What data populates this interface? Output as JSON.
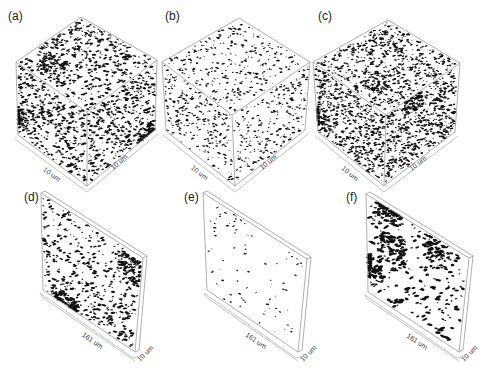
{
  "figure": {
    "width": 494,
    "height": 369,
    "background": "#ffffff",
    "particle_color": "#111111",
    "edge_color": "#9a9a9a"
  },
  "panels": [
    {
      "id": "a",
      "label": "(a)",
      "type": "cube",
      "label_pos": [
        8,
        20
      ],
      "dim_labels": [
        "10 um",
        "10 um"
      ],
      "density": 1.0,
      "cluster": 0.15,
      "size": 1.1,
      "seed": 11,
      "geom": {
        "top": [
          81,
          17
        ],
        "lt": [
          16,
          62
        ],
        "rt": [
          157,
          60
        ],
        "ft": [
          87,
          112
        ],
        "fb": [
          87,
          186
        ],
        "lb": [
          18,
          135
        ],
        "rb": [
          155,
          130
        ]
      }
    },
    {
      "id": "b",
      "label": "(b)",
      "type": "cube",
      "label_pos": [
        165,
        20
      ],
      "dim_labels": [
        "10 um",
        "10 um"
      ],
      "density": 0.55,
      "cluster": 0.0,
      "size": 0.9,
      "seed": 23,
      "geom": {
        "top": [
          239,
          18
        ],
        "lt": [
          162,
          62
        ],
        "rt": [
          310,
          62
        ],
        "ft": [
          232,
          115
        ],
        "fb": [
          235,
          186
        ],
        "lb": [
          166,
          131
        ],
        "rb": [
          305,
          130
        ]
      }
    },
    {
      "id": "c",
      "label": "(c)",
      "type": "cube",
      "label_pos": [
        318,
        20
      ],
      "dim_labels": [
        "10 um",
        "10 um"
      ],
      "density": 1.35,
      "cluster": 0.1,
      "size": 1.0,
      "seed": 37,
      "geom": {
        "top": [
          388,
          20
        ],
        "lt": [
          313,
          62
        ],
        "rt": [
          460,
          63
        ],
        "ft": [
          386,
          115
        ],
        "fb": [
          384,
          186
        ],
        "lb": [
          318,
          132
        ],
        "rb": [
          455,
          132
        ]
      }
    },
    {
      "id": "d",
      "label": "(d)",
      "type": "slab",
      "label_pos": [
        24,
        201
      ],
      "dim_labels": [
        "161 um",
        "10 um"
      ],
      "density": 0.9,
      "cluster": 0.35,
      "size": 1.2,
      "seed": 41,
      "geom": {
        "tl": [
          41,
          193
        ],
        "tr": [
          143,
          258
        ],
        "br": [
          135,
          352
        ],
        "bl": [
          43,
          290
        ],
        "thick": [
          4,
          -2
        ]
      }
    },
    {
      "id": "e",
      "label": "(e)",
      "type": "slab",
      "label_pos": [
        184,
        201
      ],
      "dim_labels": [
        "161 um",
        "10 um"
      ],
      "density": 0.12,
      "cluster": 0.2,
      "size": 0.9,
      "seed": 53,
      "geom": {
        "tl": [
          203,
          193
        ],
        "tr": [
          307,
          259
        ],
        "br": [
          298,
          352
        ],
        "bl": [
          207,
          290
        ],
        "thick": [
          4,
          -2
        ]
      }
    },
    {
      "id": "f",
      "label": "(f)",
      "type": "slab",
      "label_pos": [
        346,
        201
      ],
      "dim_labels": [
        "161 um",
        "10 um"
      ],
      "density": 0.7,
      "cluster": 0.6,
      "size": 1.5,
      "seed": 67,
      "geom": {
        "tl": [
          366,
          194
        ],
        "tr": [
          469,
          258
        ],
        "br": [
          459,
          352
        ],
        "bl": [
          368,
          292
        ],
        "thick": [
          4,
          -2
        ]
      }
    }
  ]
}
